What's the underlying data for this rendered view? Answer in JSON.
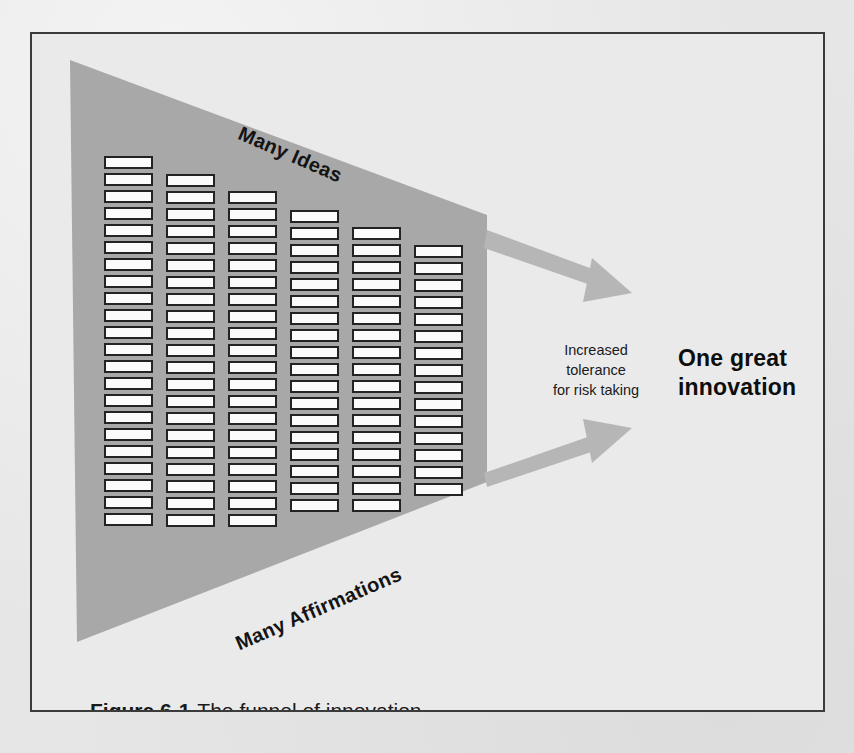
{
  "figure": {
    "caption_number": "Figure 6-1",
    "caption_text": "The funnel of innovation.",
    "title": "The funnel of innovation"
  },
  "diagram": {
    "type": "funnel",
    "top_edge_label": "Many Ideas",
    "bottom_edge_label": "Many Affirmations",
    "arrow_annotation_lines": [
      "Increased",
      "tolerance",
      "for risk taking"
    ],
    "outcome_lines": [
      "One great",
      "innovation"
    ],
    "arrow_count": 2,
    "arrows": [
      {
        "name": "upper-output-arrow",
        "direction": "down-right"
      },
      {
        "name": "lower-output-arrow",
        "direction": "up-right"
      }
    ]
  },
  "colors": {
    "page_background": "#e6e6e6",
    "frame_background": "#eaeaea",
    "frame_border": "#3b3b3b",
    "funnel_fill": "#a8a8a8",
    "bar_fill": "#fbfbfb",
    "bar_stroke": "#232323",
    "arrow_fill": "#b6b6b6",
    "text_color": "#1a1a1a"
  },
  "bar_grid": {
    "description": "Six columns of small white rectangles representing many ideas inside the funnel",
    "column_count": 6,
    "bar_counts": [
      22,
      21,
      20,
      18,
      17,
      15
    ],
    "total_bars": 113,
    "columns": [
      {
        "index": 1,
        "x": 72,
        "top": 122,
        "bar_width": 49,
        "bar_height": 13,
        "gap": 17,
        "count": 22
      },
      {
        "index": 2,
        "x": 134,
        "top": 140,
        "bar_width": 49,
        "bar_height": 13,
        "gap": 17,
        "count": 21
      },
      {
        "index": 3,
        "x": 196,
        "top": 157,
        "bar_width": 49,
        "bar_height": 13,
        "gap": 17,
        "count": 20
      },
      {
        "index": 4,
        "x": 258,
        "top": 176,
        "bar_width": 49,
        "bar_height": 13,
        "gap": 17,
        "count": 18
      },
      {
        "index": 5,
        "x": 320,
        "top": 193,
        "bar_width": 49,
        "bar_height": 13,
        "gap": 17,
        "count": 17
      },
      {
        "index": 6,
        "x": 382,
        "top": 211,
        "bar_width": 49,
        "bar_height": 13,
        "gap": 17,
        "count": 15
      }
    ]
  }
}
